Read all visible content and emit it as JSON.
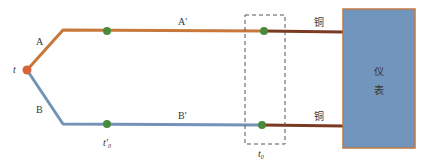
{
  "diagram": {
    "colors": {
      "wire_a": "#c8783a",
      "wire_b": "#7393b8",
      "copper": "#7a3b22",
      "junction_hot": "#d9643a",
      "junction_node": "#4a8a3c",
      "instrument_fill": "#7195bd",
      "instrument_border": "#c07a45",
      "dashed_box": "#555555"
    },
    "labels": {
      "hot_junction": "t",
      "wire_a": "A",
      "wire_a_ext": "A'",
      "wire_b": "B",
      "wire_b_ext": "B'",
      "ref_temp_prime": "t'",
      "ref_temp_prime_sub": "0",
      "ref_temp": "t",
      "ref_temp_sub": "0",
      "copper_top": "铜",
      "copper_bottom": "铜",
      "instrument_line1": "仪",
      "instrument_line2": "表"
    },
    "nodes": [
      {
        "id": "hot-junction",
        "x": 27,
        "y": 70
      },
      {
        "id": "node-a-mid",
        "x": 107,
        "y": 31
      },
      {
        "id": "node-a-cold",
        "x": 264,
        "y": 31
      },
      {
        "id": "node-b-mid",
        "x": 107,
        "y": 124
      },
      {
        "id": "node-b-cold",
        "x": 262,
        "y": 125
      }
    ]
  }
}
